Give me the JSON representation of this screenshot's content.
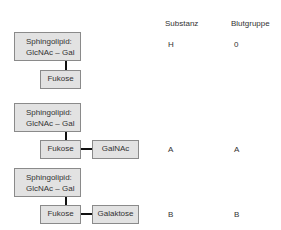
{
  "headers": {
    "substanz": "Substanz",
    "blutgruppe": "Blutgruppe"
  },
  "rows": [
    {
      "main_line1": "Sphingolipid:",
      "main_line2": "GlcNAc – Gal",
      "fucose": "Fukose",
      "extra": null,
      "substanz": "H",
      "blutgruppe": "0"
    },
    {
      "main_line1": "Sphingolipid:",
      "main_line2": "GlcNAc – Gal",
      "fucose": "Fukose",
      "extra": "GalNAc",
      "substanz": "A",
      "blutgruppe": "A"
    },
    {
      "main_line1": "Sphingolipid:",
      "main_line2": "GlcNAc – Gal",
      "fucose": "Fukose",
      "extra": "Galaktose",
      "substanz": "B",
      "blutgruppe": "B"
    }
  ],
  "colors": {
    "box_fill": "#e2e2e2",
    "box_border": "#8a8a8a",
    "connector": "#111111"
  }
}
